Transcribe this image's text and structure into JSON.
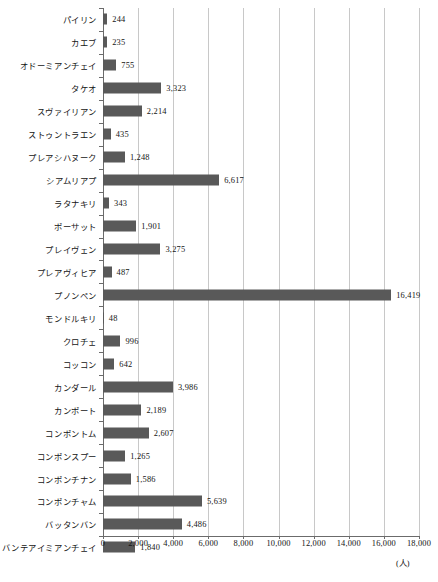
{
  "chart_data": {
    "type": "bar",
    "orientation": "horizontal",
    "title": "",
    "subtitle": "",
    "xlabel": "",
    "ylabel": "",
    "unit_label": "(人)",
    "xlim": [
      0,
      18000
    ],
    "xtick_step": 2000,
    "xticks": [
      "0",
      "2,000",
      "4,000",
      "6,000",
      "8,000",
      "10,000",
      "12,000",
      "14,000",
      "16,000",
      "18,000"
    ],
    "xtick_values": [
      0,
      2000,
      4000,
      6000,
      8000,
      10000,
      12000,
      14000,
      16000,
      18000
    ],
    "grid": "vertical",
    "legend": "none",
    "bar_color": "#595959",
    "gridline_color": "#c8c8c8",
    "axis_color": "#6b6b6b",
    "categories": [
      "パイリン",
      "カエブ",
      "オドーミアンチェイ",
      "タケオ",
      "スヴァイリアン",
      "ストゥントラエン",
      "プレアシハヌーク",
      "シアムリアプ",
      "ラタナキリ",
      "ポーサット",
      "プレイヴェン",
      "プレアヴィヒア",
      "プノンペン",
      "モンドルキリ",
      "クロチェ",
      "コッコン",
      "カンダール",
      "カンポート",
      "コンポントム",
      "コンポンスプー",
      "コンポンチナン",
      "コンポンチャム",
      "バッタンバン",
      "バンテアイミアンチェイ"
    ],
    "values": [
      244,
      235,
      755,
      3323,
      2214,
      435,
      1248,
      6617,
      343,
      1901,
      3275,
      487,
      16419,
      48,
      996,
      642,
      3986,
      2189,
      2607,
      1265,
      1586,
      5639,
      4486,
      1840
    ],
    "value_labels": [
      "244",
      "235",
      "755",
      "3,323",
      "2,214",
      "435",
      "1,248",
      "6,617",
      "343",
      "1,901",
      "3,275",
      "487",
      "16,419",
      "48",
      "996",
      "642",
      "3,986",
      "2,189",
      "2,607",
      "1,265",
      "1,586",
      "5,639",
      "4,486",
      "1,840"
    ]
  }
}
